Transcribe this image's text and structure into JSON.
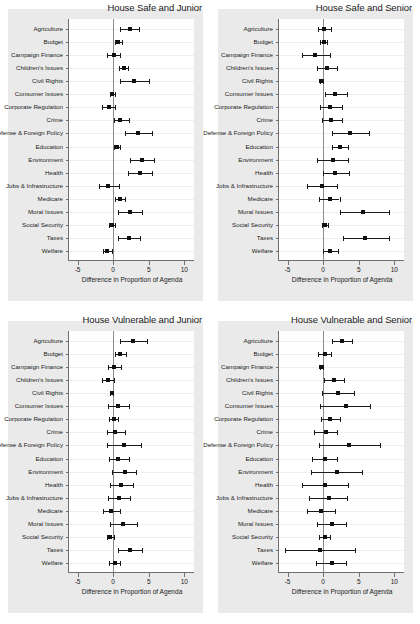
{
  "figure": {
    "background": "#ffffff",
    "panel_background": "#eaeaea",
    "plot_background": "#ffffff",
    "point_color": "#111111",
    "axis_color": "#6f6f6f",
    "zero_line_color": "#8c8c8c"
  },
  "axis": {
    "xlabel": "Difference in Proportion of Agenda",
    "ticks": [
      "-5",
      "0",
      "5",
      "10"
    ],
    "tick_values": [
      -5,
      0,
      5,
      10
    ],
    "xlim": [
      -6.2,
      11.5
    ]
  },
  "categories": [
    "Agriculture",
    "Budget",
    "Campaign Finance",
    "Children's Issues",
    "Civil Rights",
    "Consumer Issues",
    "Corporate Regulation",
    "Crime",
    "Defense & Foreign Policy",
    "Education",
    "Environment",
    "Health",
    "Jobs & Infrastructure",
    "Medicare",
    "Moral Issues",
    "Social Security",
    "Taxes",
    "Welfare"
  ],
  "chart_data": [
    {
      "type": "scatter",
      "title": "House Safe and Junior",
      "xlabel": "Difference in Proportion of Agenda",
      "ylabel": "",
      "xlim": [
        -6.2,
        11.5
      ],
      "grid": true,
      "categories": [
        "Agriculture",
        "Budget",
        "Campaign Finance",
        "Children's Issues",
        "Civil Rights",
        "Consumer Issues",
        "Corporate Regulation",
        "Crime",
        "Defense & Foreign Policy",
        "Education",
        "Environment",
        "Health",
        "Jobs & Infrastructure",
        "Medicare",
        "Moral Issues",
        "Social Security",
        "Taxes",
        "Welfare"
      ],
      "estimates": [
        2.3,
        0.7,
        0.1,
        1.5,
        3.0,
        -0.1,
        -0.6,
        1.0,
        3.5,
        0.5,
        4.0,
        3.8,
        -0.7,
        0.9,
        2.4,
        -0.2,
        2.2,
        -0.8
      ],
      "ci_low": [
        1.0,
        0.2,
        -0.9,
        0.8,
        1.0,
        -0.4,
        -1.5,
        0.1,
        1.7,
        0.1,
        2.4,
        2.1,
        -2.0,
        0.3,
        0.7,
        -0.6,
        0.7,
        -1.4
      ],
      "ci_high": [
        3.6,
        1.2,
        1.0,
        2.1,
        5.1,
        0.2,
        0.2,
        2.2,
        5.4,
        1.0,
        5.7,
        5.5,
        0.8,
        1.6,
        4.0,
        0.2,
        3.8,
        -0.2
      ]
    },
    {
      "type": "scatter",
      "title": "House Safe and Senior",
      "xlabel": "Difference in Proportion of Agenda",
      "ylabel": "",
      "xlim": [
        -6.2,
        11.5
      ],
      "grid": true,
      "categories": [
        "Agriculture",
        "Budget",
        "Campaign Finance",
        "Children's Issues",
        "Civil Rights",
        "Consumer Issues",
        "Corporate Regulation",
        "Crime",
        "Defense & Foreign Policy",
        "Education",
        "Environment",
        "Health",
        "Jobs & Infrastructure",
        "Medicare",
        "Moral Issues",
        "Social Security",
        "Taxes",
        "Welfare"
      ],
      "estimates": [
        0.1,
        0.1,
        -1.1,
        0.5,
        -0.3,
        1.6,
        1.0,
        1.1,
        3.8,
        2.3,
        1.4,
        1.7,
        -0.1,
        0.9,
        5.6,
        0.2,
        5.9,
        1.0
      ],
      "ci_low": [
        -0.7,
        -0.4,
        -2.9,
        -0.8,
        -0.5,
        0.2,
        -0.4,
        -0.2,
        1.2,
        1.2,
        -0.9,
        0.0,
        -2.2,
        -0.6,
        2.3,
        -0.2,
        2.8,
        0.0
      ],
      "ci_high": [
        1.1,
        0.6,
        0.9,
        2.0,
        0.0,
        3.3,
        2.6,
        2.6,
        6.4,
        3.5,
        3.5,
        3.7,
        1.9,
        2.3,
        9.2,
        0.7,
        9.2,
        2.1
      ]
    },
    {
      "type": "scatter",
      "title": "House Vulnerable and Junior",
      "xlabel": "Difference in Proportion of Agenda",
      "ylabel": "",
      "xlim": [
        -6.2,
        11.5
      ],
      "grid": true,
      "categories": [
        "Agriculture",
        "Budget",
        "Campaign Finance",
        "Children's Issues",
        "Civil Rights",
        "Consumer Issues",
        "Corporate Regulation",
        "Crime",
        "Defense & Foreign Policy",
        "Education",
        "Environment",
        "Health",
        "Jobs & Infrastructure",
        "Medicare",
        "Moral Issues",
        "Social Security",
        "Taxes",
        "Welfare"
      ],
      "estimates": [
        2.8,
        1.0,
        0.1,
        -0.7,
        -0.2,
        0.7,
        0.1,
        0.2,
        1.5,
        0.7,
        1.6,
        1.1,
        0.8,
        -0.3,
        1.4,
        -0.4,
        2.3,
        0.2
      ],
      "ci_low": [
        0.9,
        0.3,
        -0.7,
        -1.6,
        -0.4,
        -0.7,
        -0.6,
        -0.9,
        -0.8,
        -0.6,
        -0.1,
        -0.4,
        -0.7,
        -1.4,
        -0.5,
        -0.8,
        0.7,
        -0.6
      ],
      "ci_high": [
        4.8,
        1.8,
        1.1,
        0.1,
        0.0,
        2.2,
        0.7,
        1.6,
        3.9,
        2.2,
        3.2,
        2.8,
        2.4,
        1.0,
        3.4,
        0.1,
        4.1,
        0.9
      ]
    },
    {
      "type": "scatter",
      "title": "House Vulnerable and Senior",
      "xlabel": "Difference in Proportion of Agenda",
      "ylabel": "",
      "xlim": [
        -6.2,
        11.5
      ],
      "grid": true,
      "categories": [
        "Agriculture",
        "Budget",
        "Campaign Finance",
        "Children's Issues",
        "Civil Rights",
        "Consumer Issues",
        "Corporate Regulation",
        "Crime",
        "Defense & Foreign Policy",
        "Education",
        "Environment",
        "Health",
        "Jobs & Infrastructure",
        "Medicare",
        "Moral Issues",
        "Social Security",
        "Taxes",
        "Welfare"
      ],
      "estimates": [
        2.6,
        0.2,
        -0.3,
        1.5,
        2.1,
        3.2,
        1.0,
        0.4,
        3.7,
        0.2,
        1.9,
        0.3,
        0.8,
        -0.3,
        1.3,
        0.2,
        -0.4,
        1.2
      ],
      "ci_low": [
        1.2,
        -0.7,
        -0.5,
        0.1,
        -0.1,
        -0.5,
        -0.3,
        -1.3,
        -0.6,
        -1.5,
        -1.7,
        -3.0,
        -2.0,
        -2.2,
        -0.8,
        -0.6,
        -5.3,
        -1.0
      ],
      "ci_high": [
        4.1,
        1.1,
        0.0,
        2.9,
        4.3,
        6.6,
        2.4,
        1.9,
        8.0,
        2.0,
        5.5,
        3.5,
        3.4,
        1.7,
        3.2,
        1.0,
        4.5,
        3.2
      ]
    }
  ]
}
